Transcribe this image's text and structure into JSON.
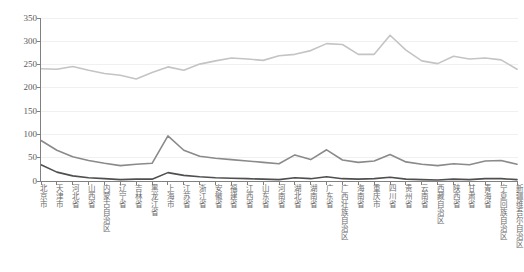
{
  "chart_data": {
    "type": "line",
    "title": "",
    "subtitle": "",
    "xlabel": "",
    "ylabel": "",
    "ylim": [
      0,
      350
    ],
    "yticks": [
      0,
      50,
      100,
      150,
      200,
      250,
      300,
      350
    ],
    "grid": true,
    "legend": "none",
    "categories": [
      "北京市",
      "天津市",
      "河北省",
      "山西省",
      "内蒙古自治区",
      "辽宁省",
      "吉林省",
      "黑龙江省",
      "上海市",
      "江苏省",
      "浙江省",
      "安徽省",
      "福建省",
      "江西省",
      "山东省",
      "河南省",
      "湖北省",
      "湖南省",
      "广东省",
      "广西壮族自治区",
      "海南省",
      "重庆市",
      "四川省",
      "贵州省",
      "云南省",
      "西藏自治区",
      "陕西省",
      "甘肃省",
      "青海省",
      "宁夏回族自治区",
      "新疆维吾尔自治区"
    ],
    "series": [
      {
        "name": "series-upper",
        "color": "#c4c4c4",
        "values": [
          241,
          240,
          246,
          238,
          231,
          227,
          219,
          233,
          245,
          238,
          251,
          258,
          264,
          262,
          259,
          269,
          272,
          280,
          295,
          293,
          272,
          272,
          313,
          281,
          258,
          252,
          268,
          262,
          264,
          260,
          240
        ]
      },
      {
        "name": "series-middle",
        "color": "#8a8a8a",
        "values": [
          87,
          66,
          52,
          44,
          38,
          33,
          36,
          38,
          97,
          66,
          53,
          49,
          46,
          43,
          40,
          37,
          56,
          46,
          67,
          45,
          40,
          43,
          57,
          41,
          36,
          33,
          37,
          35,
          43,
          44,
          36
        ]
      },
      {
        "name": "series-lower",
        "color": "#4f4f4f",
        "values": [
          35,
          19,
          11,
          7,
          5,
          3,
          4,
          4,
          18,
          12,
          9,
          7,
          6,
          5,
          4,
          3,
          7,
          5,
          9,
          5,
          4,
          5,
          8,
          4,
          3,
          2,
          4,
          3,
          5,
          5,
          3
        ]
      }
    ]
  },
  "axis": {
    "axis_color": "#808080",
    "grid_color": "#f0f0f0",
    "label_color": "#595959"
  }
}
